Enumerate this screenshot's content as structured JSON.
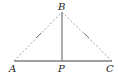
{
  "diagram": {
    "type": "geometry-triangle",
    "points": {
      "A": {
        "label": "A",
        "x": 14,
        "y": 61
      },
      "B": {
        "label": "B",
        "x": 62,
        "y": 12
      },
      "C": {
        "label": "C",
        "x": 112,
        "y": 61
      },
      "P": {
        "label": "P",
        "x": 62,
        "y": 61
      }
    },
    "segments": [
      {
        "from": "A",
        "to": "B",
        "style": "dashed",
        "tick_marks": 1
      },
      {
        "from": "B",
        "to": "C",
        "style": "dashed",
        "tick_marks": 1
      },
      {
        "from": "A",
        "to": "C",
        "style": "solid"
      },
      {
        "from": "B",
        "to": "P",
        "style": "solid"
      }
    ],
    "colors": {
      "solid": "#808080",
      "dashed": "#a0a0a0",
      "label": "#222222"
    }
  }
}
